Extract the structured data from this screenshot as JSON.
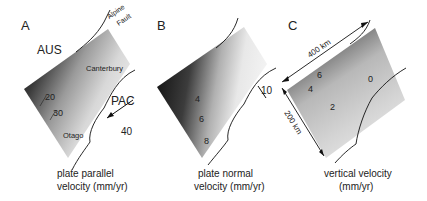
{
  "figure": {
    "panels": [
      {
        "id": "A",
        "letter": "A",
        "caption_line1": "plate parallel",
        "caption_line2": "velocity (mm/yr)",
        "labels": {
          "plate_west": "AUS",
          "plate_east": "PAC",
          "fault_line1": "Alpine",
          "fault_line2": "Fault",
          "region_north": "Canterbury",
          "region_south": "Otago"
        },
        "contours": [
          "20",
          "30"
        ],
        "arrow_label": "40"
      },
      {
        "id": "B",
        "letter": "B",
        "caption_line1": "plate normal",
        "caption_line2": "velocity (mm/yr)",
        "contours": [
          "4",
          "6",
          "8"
        ],
        "arrow_label": "10"
      },
      {
        "id": "C",
        "letter": "C",
        "caption_line1": "vertical velocity",
        "caption_line2": "(mm/yr)",
        "contours": [
          "6",
          "4",
          "2",
          "0"
        ],
        "scale_length": "400 km",
        "scale_width": "200 km"
      }
    ]
  }
}
